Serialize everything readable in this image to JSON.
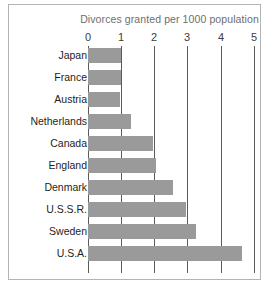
{
  "chart_data": {
    "type": "bar",
    "orientation": "horizontal",
    "title": "Divorces granted per 1000 population",
    "xlabel": "",
    "ylabel": "",
    "categories": [
      "Japan",
      "France",
      "Austria",
      "Netherlands",
      "Canada",
      "England",
      "Denmark",
      "U.S.S.R.",
      "Sweden",
      "U.S.A."
    ],
    "values": [
      1.0,
      1.0,
      0.95,
      1.3,
      1.95,
      2.05,
      2.55,
      2.95,
      3.25,
      4.65
    ],
    "xlim": [
      0,
      5
    ],
    "xticks": [
      0,
      1,
      2,
      3,
      4,
      5
    ],
    "xtick_labels": [
      "0",
      "1",
      "2",
      "3",
      "4",
      "5"
    ],
    "grid": true,
    "grid_axis": "x",
    "legend": false,
    "bar_color": "#9a9a9a",
    "gridline_color": "#5a5a5a",
    "title_color": "#6e6e6e",
    "label_color": "#1e1e1e",
    "frame_color": "#b4b4b4",
    "background": "#ffffff"
  }
}
